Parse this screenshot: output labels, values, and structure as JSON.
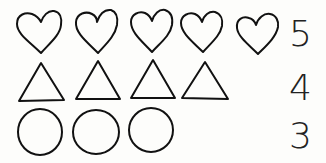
{
  "title": "",
  "rows": [
    {
      "shape": "heart",
      "count": 5,
      "label": "5"
    },
    {
      "shape": "triangle",
      "count": 4,
      "label": "4"
    },
    {
      "shape": "circle",
      "count": 3,
      "label": "3"
    }
  ],
  "stroke_color": "#111111",
  "background": "#fdfdfb"
}
